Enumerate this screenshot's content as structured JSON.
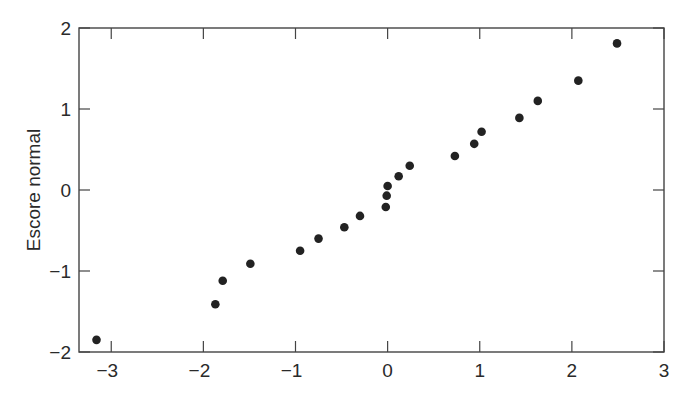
{
  "chart_data": {
    "type": "scatter",
    "title": "",
    "xlabel": "",
    "ylabel": "Escore normal",
    "xlim": [
      -3.35,
      3
    ],
    "ylim": [
      -2,
      2
    ],
    "xticks": [
      -3,
      -2,
      -1,
      0,
      1,
      2,
      3
    ],
    "yticks": [
      -2,
      -1,
      0,
      1,
      2
    ],
    "xtick_labels": [
      "−3",
      "−2",
      "−1",
      "0",
      "1",
      "2",
      "3"
    ],
    "ytick_labels": [
      "−2",
      "−1",
      "0",
      "1",
      "2"
    ],
    "grid": false,
    "legend": null,
    "marker_color": "#222222",
    "frame_color": "#444444",
    "points": [
      {
        "x": -3.16,
        "y": -1.85
      },
      {
        "x": -1.87,
        "y": -1.41
      },
      {
        "x": -1.79,
        "y": -1.12
      },
      {
        "x": -1.49,
        "y": -0.91
      },
      {
        "x": -0.95,
        "y": -0.75
      },
      {
        "x": -0.75,
        "y": -0.6
      },
      {
        "x": -0.47,
        "y": -0.46
      },
      {
        "x": -0.3,
        "y": -0.32
      },
      {
        "x": -0.02,
        "y": -0.21
      },
      {
        "x": -0.01,
        "y": -0.07
      },
      {
        "x": 0.0,
        "y": 0.05
      },
      {
        "x": 0.12,
        "y": 0.17
      },
      {
        "x": 0.24,
        "y": 0.3
      },
      {
        "x": 0.73,
        "y": 0.42
      },
      {
        "x": 0.94,
        "y": 0.57
      },
      {
        "x": 1.02,
        "y": 0.72
      },
      {
        "x": 1.43,
        "y": 0.89
      },
      {
        "x": 1.63,
        "y": 1.1
      },
      {
        "x": 2.07,
        "y": 1.35
      },
      {
        "x": 2.49,
        "y": 1.81
      }
    ]
  }
}
